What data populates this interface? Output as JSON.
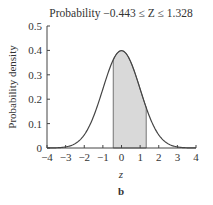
{
  "chart_data": {
    "type": "area",
    "title": "Probability −0.443 ≤ Z ≤ 1.328",
    "xlabel": "z",
    "ylabel": "Probability density",
    "panel_label": "b",
    "xlim": [
      -4,
      4
    ],
    "ylim": [
      0,
      0.5
    ],
    "x_ticks": [
      "−4",
      "−3",
      "−2",
      "−1",
      "0",
      "1",
      "2",
      "3",
      "4"
    ],
    "y_ticks": [
      "0",
      "0.1",
      "0.2",
      "0.3",
      "0.4",
      "0.5"
    ],
    "series": [
      {
        "name": "Standard normal density",
        "x": [
          -4,
          -3.5,
          -3,
          -2.5,
          -2,
          -1.5,
          -1,
          -0.5,
          0,
          0.5,
          1,
          1.5,
          2,
          2.5,
          3,
          3.5,
          4
        ],
        "values": [
          0.0001,
          0.0009,
          0.0044,
          0.0175,
          0.054,
          0.1295,
          0.242,
          0.3521,
          0.3989,
          0.3521,
          0.242,
          0.1295,
          0.054,
          0.0175,
          0.0044,
          0.0009,
          0.0001
        ]
      }
    ],
    "shaded_region": {
      "from": -0.443,
      "to": 1.328,
      "color": "#d9d9d9"
    },
    "grid": false,
    "legend": null
  }
}
